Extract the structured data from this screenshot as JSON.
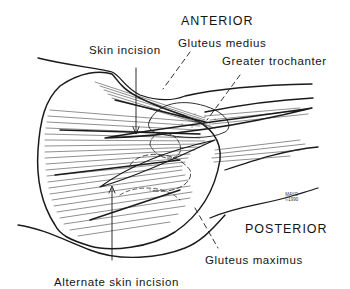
{
  "figure": {
    "orientation": {
      "top": "ANTERIOR",
      "bottom": "POSTERIOR"
    },
    "labels": {
      "skin_incision": "Skin incision",
      "gluteus_medius": "Gluteus medius",
      "greater_trochanter": "Greater trochanter",
      "gluteus_maximus": "Gluteus maximus",
      "alternate_skin_incision": "Alternate skin incision"
    },
    "signature": {
      "line1": "MAYO",
      "line2": "©1990"
    },
    "colors": {
      "ink": "#141414",
      "background": "#ffffff"
    }
  }
}
